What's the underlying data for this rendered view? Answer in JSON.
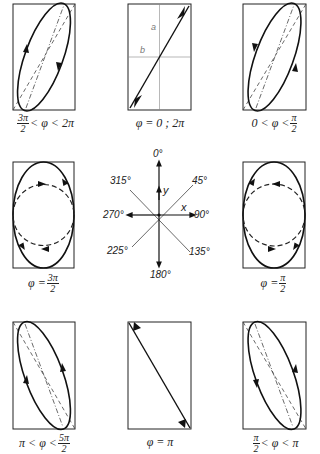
{
  "figure": {
    "panels": [
      {
        "id": "top-left",
        "label_pre": "",
        "frac_num": "3π",
        "frac_den": "2",
        "label_post": "< φ < 2π",
        "shape": "ellipse-tilted-right",
        "direction": "counterclockwise"
      },
      {
        "id": "top-center",
        "label": "φ = 0 ; 2π",
        "shape": "line-positive-slope",
        "axis_labels": {
          "a": "a",
          "b": "b"
        }
      },
      {
        "id": "top-right",
        "label_pre": "0 < φ <",
        "frac_num": "π",
        "frac_den": "2",
        "label_post": "",
        "shape": "ellipse-tilted-right",
        "direction": "clockwise"
      },
      {
        "id": "middle-left",
        "label_pre": "φ =",
        "frac_num": "3π",
        "frac_den": "2",
        "label_post": "",
        "shape": "ellipse-vertical",
        "direction": "clockwise"
      },
      {
        "id": "middle-right",
        "label_pre": "φ =",
        "frac_num": "π",
        "frac_den": "2",
        "label_post": "",
        "shape": "ellipse-vertical",
        "direction": "counterclockwise"
      },
      {
        "id": "bottom-left",
        "label_pre": "π < φ <",
        "frac_num": "5π",
        "frac_den": "2",
        "label_post": "",
        "shape": "ellipse-tilted-left",
        "direction": "clockwise"
      },
      {
        "id": "bottom-center",
        "label": "φ = π",
        "shape": "line-negative-slope"
      },
      {
        "id": "bottom-right",
        "label_pre": "",
        "frac_num": "π",
        "frac_den": "2",
        "label_post": "< φ < π",
        "shape": "ellipse-tilted-left",
        "direction": "counterclockwise"
      }
    ],
    "compass": {
      "angles": {
        "n": "0°",
        "ne": "45°",
        "e": "90°",
        "se": "135°",
        "s": "180°",
        "sw": "225°",
        "w": "270°",
        "nw": "315°"
      },
      "axis_x": "x",
      "axis_y": "y"
    }
  }
}
